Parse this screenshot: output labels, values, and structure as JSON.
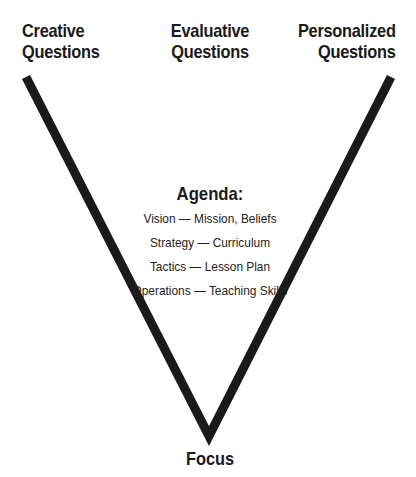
{
  "diagram": {
    "headings": {
      "left": [
        "Creative",
        "Questions"
      ],
      "center": [
        "Evaluative",
        "Questions"
      ],
      "right": [
        "Personalized",
        "Questions"
      ]
    },
    "agenda": {
      "title": "Agenda:",
      "items": [
        "Vision — Mission, Beliefs",
        "Strategy — Curriculum",
        "Tactics — Lesson Plan",
        "Operations — Teaching Skills"
      ]
    },
    "bottom_label": "Focus",
    "colors": {
      "line": "#1a1a1a",
      "text": "#1a1a1a",
      "background": "#ffffff"
    }
  }
}
